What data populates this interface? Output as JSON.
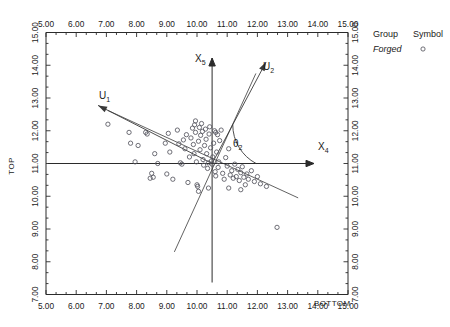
{
  "chart_data": {
    "type": "scatter",
    "title": "",
    "xlabel": "BOTTOM",
    "ylabel": "TOP",
    "xlim": [
      5.0,
      15.0
    ],
    "ylim": [
      7.0,
      15.0
    ],
    "grid": false,
    "x_ticks": [
      "5.00",
      "6.00",
      "7.00",
      "8.00",
      "9.00",
      "10.00",
      "11.00",
      "12.00",
      "13.00",
      "14.00",
      "15.00"
    ],
    "y_ticks": [
      "7.00",
      "8.00",
      "9.00",
      "10.00",
      "11.00",
      "12.00",
      "13.00",
      "14.00",
      "15.00"
    ],
    "x_tick_values": [
      5,
      6,
      7,
      8,
      9,
      10,
      11,
      12,
      13,
      14,
      15
    ],
    "y_tick_values": [
      7,
      8,
      9,
      10,
      11,
      12,
      13,
      14,
      15
    ],
    "minor_ticks_per_interval": 2,
    "axes_mirrored_top": true,
    "axes_mirrored_right": true,
    "legend": {
      "position": "outside-right-top",
      "header_group": "Group",
      "header_symbol": "Symbol",
      "entries": [
        {
          "label": "Forged",
          "symbol": "open-circle",
          "italic": true
        }
      ]
    },
    "annotations": {
      "pc_axis_horizontal_label": "X",
      "pc_axis_horizontal_sub": "4",
      "pc_axis_vertical_label": "X",
      "pc_axis_vertical_sub": "5",
      "vector_1_label": "U",
      "vector_1_sub": "1",
      "vector_2_label": "U",
      "vector_2_sub": "2",
      "angle_label": "θ",
      "angle_sub": "2",
      "pc_origin": [
        10.5,
        11.0
      ],
      "vector_1_direction_deg": 153,
      "vector_2_direction_deg": 62,
      "angle_arc_from_deg": 0,
      "angle_arc_to_deg": 62
    },
    "colors": {
      "axis": "#2b2b2b",
      "marker_stroke": "#55555f",
      "vector": "#3a3a3a",
      "background": "#ffffff"
    },
    "series": [
      {
        "name": "Forged",
        "symbol": "open-circle",
        "points": [
          [
            7.05,
            12.2
          ],
          [
            7.75,
            11.95
          ],
          [
            7.8,
            11.62
          ],
          [
            7.95,
            11.05
          ],
          [
            8.05,
            11.55
          ],
          [
            8.3,
            11.95
          ],
          [
            8.35,
            11.9
          ],
          [
            8.45,
            10.55
          ],
          [
            8.5,
            10.7
          ],
          [
            8.55,
            10.58
          ],
          [
            8.6,
            11.3
          ],
          [
            8.7,
            11.0
          ],
          [
            8.95,
            11.62
          ],
          [
            9.0,
            10.68
          ],
          [
            9.05,
            11.92
          ],
          [
            9.1,
            11.35
          ],
          [
            9.2,
            10.52
          ],
          [
            9.35,
            12.02
          ],
          [
            9.4,
            11.6
          ],
          [
            9.45,
            11.02
          ],
          [
            9.5,
            10.98
          ],
          [
            9.55,
            11.72
          ],
          [
            9.6,
            11.45
          ],
          [
            9.65,
            11.88
          ],
          [
            9.7,
            10.42
          ],
          [
            9.75,
            11.2
          ],
          [
            9.8,
            11.78
          ],
          [
            9.85,
            12.08
          ],
          [
            9.88,
            11.58
          ],
          [
            9.9,
            11.3
          ],
          [
            9.92,
            12.18
          ],
          [
            9.95,
            11.95
          ],
          [
            9.98,
            11.05
          ],
          [
            10.0,
            10.35
          ],
          [
            10.02,
            10.3
          ],
          [
            10.05,
            11.68
          ],
          [
            10.08,
            12.1
          ],
          [
            10.1,
            11.42
          ],
          [
            10.12,
            11.86
          ],
          [
            10.15,
            12.22
          ],
          [
            10.18,
            11.98
          ],
          [
            10.2,
            11.12
          ],
          [
            10.22,
            10.95
          ],
          [
            10.25,
            11.55
          ],
          [
            10.28,
            12.05
          ],
          [
            10.3,
            11.74
          ],
          [
            10.32,
            11.3
          ],
          [
            10.35,
            10.85
          ],
          [
            10.38,
            11.02
          ],
          [
            10.4,
            11.9
          ],
          [
            10.42,
            12.12
          ],
          [
            10.45,
            11.48
          ],
          [
            10.48,
            11.08
          ],
          [
            10.5,
            10.98
          ],
          [
            10.52,
            11.2
          ],
          [
            10.55,
            11.62
          ],
          [
            10.58,
            12.0
          ],
          [
            10.6,
            10.75
          ],
          [
            10.62,
            10.62
          ],
          [
            10.65,
            11.35
          ],
          [
            10.68,
            11.88
          ],
          [
            10.7,
            10.88
          ],
          [
            10.72,
            11.05
          ],
          [
            10.75,
            11.7
          ],
          [
            10.8,
            12.02
          ],
          [
            10.85,
            10.7
          ],
          [
            10.9,
            10.52
          ],
          [
            10.95,
            11.18
          ],
          [
            11.0,
            10.92
          ],
          [
            11.05,
            11.45
          ],
          [
            11.1,
            10.65
          ],
          [
            11.15,
            10.78
          ],
          [
            11.2,
            10.55
          ],
          [
            11.25,
            10.98
          ],
          [
            11.3,
            10.6
          ],
          [
            11.35,
            10.82
          ],
          [
            11.4,
            10.48
          ],
          [
            11.45,
            10.72
          ],
          [
            11.5,
            10.9
          ],
          [
            11.55,
            10.58
          ],
          [
            11.6,
            10.35
          ],
          [
            11.65,
            10.68
          ],
          [
            11.7,
            10.52
          ],
          [
            11.8,
            10.78
          ],
          [
            11.9,
            10.45
          ],
          [
            12.0,
            10.6
          ],
          [
            12.1,
            10.38
          ],
          [
            12.3,
            10.3
          ],
          [
            12.65,
            9.05
          ],
          [
            10.05,
            10.15
          ],
          [
            10.38,
            10.25
          ],
          [
            11.05,
            10.25
          ],
          [
            11.45,
            10.2
          ],
          [
            9.95,
            12.3
          ],
          [
            10.62,
            11.95
          ]
        ]
      }
    ],
    "reference_lines": [
      {
        "name": "u1-axis",
        "from": [
          7.05,
          12.62
        ],
        "to": [
          13.35,
          9.95
        ]
      },
      {
        "name": "u2-axis",
        "from": [
          9.25,
          8.3
        ],
        "to": [
          11.95,
          13.75
        ]
      }
    ]
  }
}
